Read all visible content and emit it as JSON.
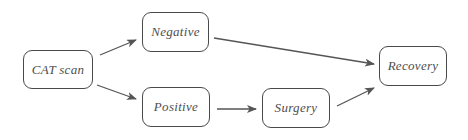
{
  "diagram": {
    "type": "flowchart",
    "colors": {
      "background": "#ffffff",
      "border": "#4a4a4a",
      "text": "#4e4e4e",
      "arrow": "#555555"
    },
    "nodes": [
      {
        "id": "cat_scan",
        "label": "CAT scan"
      },
      {
        "id": "negative",
        "label": "Negative"
      },
      {
        "id": "positive",
        "label": "Positive"
      },
      {
        "id": "surgery",
        "label": "Surgery"
      },
      {
        "id": "recovery",
        "label": "Recovery"
      }
    ],
    "edges": [
      {
        "from": "cat_scan",
        "to": "negative"
      },
      {
        "from": "cat_scan",
        "to": "positive"
      },
      {
        "from": "negative",
        "to": "recovery"
      },
      {
        "from": "positive",
        "to": "surgery"
      },
      {
        "from": "surgery",
        "to": "recovery"
      }
    ]
  }
}
